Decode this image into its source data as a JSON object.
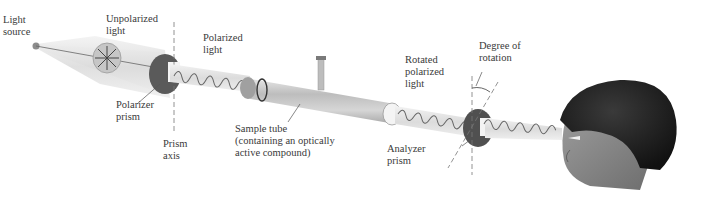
{
  "diagram": {
    "labels": {
      "light_source": "Light\nsource",
      "unpolarized_light": "Unpolarized\nlight",
      "polarized_light": "Polarized\nlight",
      "polarizer_prism": "Polarizer\nprism",
      "prism_axis": "Prism\naxis",
      "sample_tube": "Sample tube\n(containing an optically\nactive compound)",
      "rotated_polarized_light": "Rotated\npolarized\nlight",
      "degree_of_rotation": "Degree of\nrotation",
      "analyzer_prism": "Analyzer\nprism"
    },
    "colors": {
      "beam": "#e4e4e4",
      "prism": "#555555",
      "tube": "#c9c9c9",
      "text": "#3a3a3a",
      "hair": "#1e1e1e",
      "skin": "#8a8a8a"
    }
  }
}
